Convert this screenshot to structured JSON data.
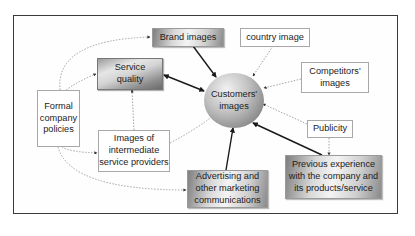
{
  "diagram": {
    "type": "concept-map",
    "central_node": {
      "id": "customers-images",
      "label_line1": "Customers'",
      "label_line2": "images",
      "shape": "ellipse"
    },
    "nodes": {
      "brand_images": {
        "label": "Brand images",
        "style": "gradient"
      },
      "country_image": {
        "label": "country image",
        "style": "plain"
      },
      "service_quality": {
        "label_line1": "Service",
        "label_line2": "quality",
        "style": "gradient-dark"
      },
      "competitors_images": {
        "label_line1": "Competitors'",
        "label_line2": "images",
        "style": "plain"
      },
      "formal_company_policies": {
        "label_line1": "Formal",
        "label_line2": "company",
        "label_line3": "policies",
        "style": "plain"
      },
      "intermediate_providers": {
        "label_line1": "Images of",
        "label_line2": "intermediate",
        "label_line3": "service providers",
        "style": "plain"
      },
      "publicity": {
        "label": "Publicity",
        "style": "plain"
      },
      "advertising": {
        "label_line1": "Advertising and",
        "label_line2": "other marketing",
        "label_line3": "communications",
        "style": "gradient"
      },
      "previous_experience": {
        "label_line1": "Previous experience",
        "label_line2": "with the company and",
        "label_line3": "its products/service",
        "style": "gradient"
      }
    },
    "edges": [
      {
        "from": "brand_images",
        "to": "customers-images",
        "style": "solid"
      },
      {
        "from": "service_quality",
        "to": "customers-images",
        "style": "solid",
        "bidirectional": true
      },
      {
        "from": "advertising",
        "to": "customers-images",
        "style": "solid"
      },
      {
        "from": "previous_experience",
        "to": "customers-images",
        "style": "solid"
      },
      {
        "from": "country_image",
        "to": "customers-images",
        "style": "dotted"
      },
      {
        "from": "competitors_images",
        "to": "customers-images",
        "style": "dotted"
      },
      {
        "from": "publicity",
        "to": "customers-images",
        "style": "dotted"
      },
      {
        "from": "intermediate_providers",
        "to": "customers-images",
        "style": "dotted"
      },
      {
        "from": "intermediate_providers",
        "to": "service_quality",
        "style": "dotted"
      },
      {
        "from": "formal_company_policies",
        "to": "brand_images",
        "style": "dotted"
      },
      {
        "from": "formal_company_policies",
        "to": "service_quality",
        "style": "dotted"
      },
      {
        "from": "formal_company_policies",
        "to": "intermediate_providers",
        "style": "dotted"
      },
      {
        "from": "formal_company_policies",
        "to": "advertising",
        "style": "dotted"
      },
      {
        "from": "publicity",
        "to": "previous_experience",
        "style": "dotted"
      }
    ],
    "colors": {
      "frame": "#3a3a3a",
      "solid_edge": "#1a1a1a",
      "dotted_edge": "#9a9a9a",
      "plain_border": "#a8a8a8"
    }
  }
}
